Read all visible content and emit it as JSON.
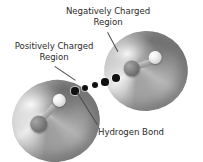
{
  "figure": {
    "background_color": "#ffffff",
    "width": 203,
    "height": 162
  },
  "labels": {
    "negative_region": {
      "line1": "Negatively Charged",
      "line2": "Region"
    },
    "positive_region": {
      "line1": "Positively Charged",
      "line2": "Region"
    },
    "hydrogen_bond": {
      "line1": "Hydrogen Bond"
    }
  },
  "colors": {
    "text": "#2b2b2b",
    "leader_line": "#4a4a4a",
    "dot": "#111111",
    "oxygen_atom": "#737373",
    "hydrogen_atom": "#f2f2f2",
    "disc_light": "#efefef",
    "disc_dark": "#6a6a6a"
  },
  "molecules": [
    {
      "name": "water-molecule-lower-left",
      "atoms": [
        {
          "element": "oxygen",
          "shade": "dark-gray"
        },
        {
          "element": "hydrogen",
          "shade": "white"
        }
      ]
    },
    {
      "name": "water-molecule-upper-right",
      "atoms": [
        {
          "element": "oxygen",
          "shade": "dark-gray"
        },
        {
          "element": "hydrogen",
          "shade": "white"
        }
      ]
    }
  ],
  "hydrogen_bond": {
    "style": "dotted",
    "dot_count": 5,
    "dots": [
      {
        "x": 75,
        "y": 91,
        "r": 3.6
      },
      {
        "x": 85,
        "y": 88,
        "r": 3.4
      },
      {
        "x": 95,
        "y": 85,
        "r": 3.4
      },
      {
        "x": 105,
        "y": 82,
        "r": 3.6
      },
      {
        "x": 116,
        "y": 78,
        "r": 3.8
      }
    ]
  }
}
